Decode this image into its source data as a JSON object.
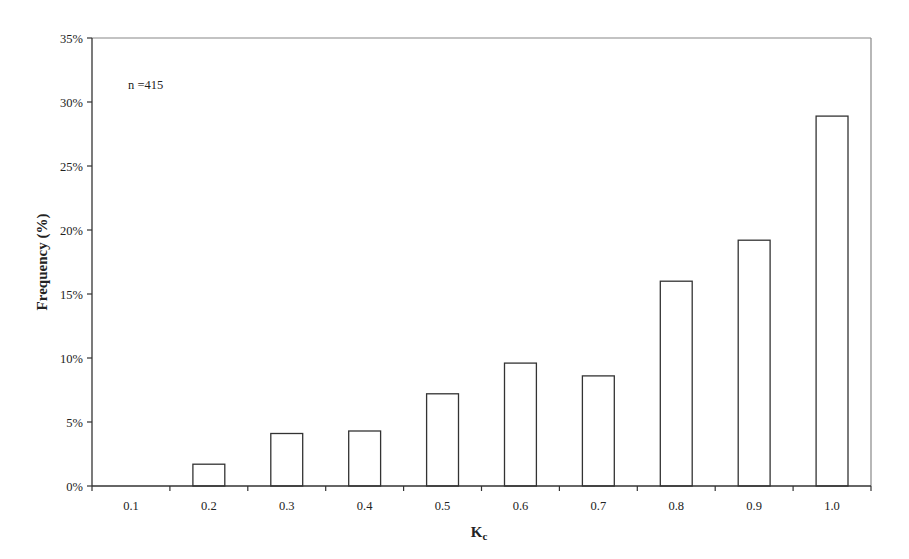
{
  "chart_data": {
    "type": "bar",
    "title": "",
    "xlabel": "K",
    "xlabel_subscript": "c",
    "ylabel": "Frequency (%)",
    "categories": [
      "0.1",
      "0.2",
      "0.3",
      "0.4",
      "0.5",
      "0.6",
      "0.7",
      "0.8",
      "0.9",
      "1.0"
    ],
    "values": [
      0,
      1.7,
      4.1,
      4.3,
      7.2,
      9.6,
      8.6,
      16.0,
      19.2,
      28.9
    ],
    "ylim": [
      0,
      35
    ],
    "yticks": [
      0,
      5,
      10,
      15,
      20,
      25,
      30,
      35
    ],
    "ytick_labels": [
      "0%",
      "5%",
      "10%",
      "15%",
      "20%",
      "25%",
      "30%",
      "35%"
    ],
    "grid": false,
    "legend": null,
    "annotations": [
      "n =415"
    ],
    "bar_fill": "#ffffff",
    "bar_stroke": "#333333",
    "frame_color": "#888888"
  }
}
